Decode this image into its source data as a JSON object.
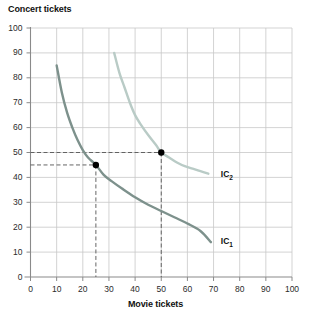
{
  "chart_data": {
    "type": "line",
    "title": "",
    "xlabel": "Movie tickets",
    "ylabel": "Concert tickets",
    "xlim": [
      0,
      100
    ],
    "ylim": [
      0,
      100
    ],
    "xticks": [
      0,
      10,
      20,
      30,
      40,
      50,
      60,
      70,
      80,
      90,
      100
    ],
    "yticks": [
      0,
      10,
      20,
      30,
      40,
      50,
      60,
      70,
      80,
      90,
      100
    ],
    "xtick_labels": [
      "0",
      "10",
      "20",
      "30",
      "40",
      "50",
      "60",
      "70",
      "80",
      "90",
      "100"
    ],
    "ytick_labels": [
      "0",
      "10",
      "20",
      "30",
      "40",
      "50",
      "60",
      "70",
      "80",
      "90",
      "100"
    ],
    "grid": true,
    "legend_position": "inline-right",
    "series": [
      {
        "name": "IC1",
        "label": "IC",
        "label_subscript": "1",
        "color": "#7d918c",
        "x": [
          10,
          12,
          14,
          16,
          18,
          20,
          22,
          25,
          28,
          31,
          35,
          40,
          45,
          50,
          55,
          60,
          65,
          69
        ],
        "y": [
          85,
          74,
          66,
          60,
          55,
          51,
          48,
          45,
          41,
          38.5,
          35.5,
          32,
          29,
          26.5,
          24,
          21.5,
          18.5,
          14
        ]
      },
      {
        "name": "IC2",
        "label": "IC",
        "label_subscript": "2",
        "color": "#b9cbc6",
        "x": [
          32,
          34,
          36,
          38,
          40,
          42,
          45,
          48,
          50,
          53,
          56,
          59,
          62,
          65,
          68
        ],
        "y": [
          90,
          82,
          76,
          70,
          65,
          61.5,
          57,
          53,
          50,
          48,
          46,
          44.5,
          43.5,
          42.5,
          41.5
        ]
      }
    ],
    "points": [
      {
        "name": "point-ic1",
        "x": 25,
        "y": 45,
        "color": "#000000"
      },
      {
        "name": "point-ic2",
        "x": 50,
        "y": 50,
        "color": "#000000"
      }
    ],
    "guides": [
      {
        "name": "hline-50",
        "type": "horizontal",
        "value": 50,
        "from_x": 0,
        "to_x": 50
      },
      {
        "name": "hline-45",
        "type": "horizontal",
        "value": 45,
        "from_x": 0,
        "to_x": 25
      },
      {
        "name": "vline-25",
        "type": "vertical",
        "value": 25,
        "from_y": 0,
        "to_y": 45
      },
      {
        "name": "vline-50",
        "type": "vertical",
        "value": 50,
        "from_y": 0,
        "to_y": 50
      }
    ],
    "annotations": [
      {
        "name": "ic2-label",
        "text": "IC2",
        "x": 72,
        "y": 41
      },
      {
        "name": "ic1-label",
        "text": "IC1",
        "x": 72,
        "y": 14
      }
    ],
    "colors": {
      "grid": "#c8c8c8",
      "axis": "#8a8a8a",
      "guide": "#555555",
      "ic1": "#7d918c",
      "ic2": "#b9cbc6",
      "text": "#111111"
    }
  }
}
